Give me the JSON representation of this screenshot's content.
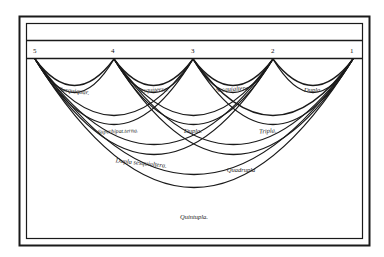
{
  "diagram": {
    "type": "ratio-arc-diagram",
    "numbers": [
      {
        "label": "5",
        "x": 35
      },
      {
        "label": "4",
        "x": 114
      },
      {
        "label": "3",
        "x": 193
      },
      {
        "label": "2",
        "x": 273
      },
      {
        "label": "1",
        "x": 353
      }
    ],
    "arcs": [
      {
        "from": "5",
        "to": "4",
        "label": "Sesquiquar."
      },
      {
        "from": "4",
        "to": "3",
        "label": "Sesquiterza."
      },
      {
        "from": "3",
        "to": "2",
        "label": "Sesquialtera."
      },
      {
        "from": "2",
        "to": "1",
        "label": "Dupla."
      },
      {
        "from": "5",
        "to": "3",
        "label": "Superbipat.terna."
      },
      {
        "from": "4",
        "to": "2",
        "label": "Dupla."
      },
      {
        "from": "3",
        "to": "1",
        "label": "Tripla."
      },
      {
        "from": "5",
        "to": "2",
        "label": "Dupla sesquialtera."
      },
      {
        "from": "4",
        "to": "1",
        "label": "Quadrupla"
      },
      {
        "from": "5",
        "to": "1",
        "label": "Quintupla."
      }
    ],
    "colors": {
      "ink": "#1a1a1a",
      "paper": "#ffffff"
    }
  }
}
